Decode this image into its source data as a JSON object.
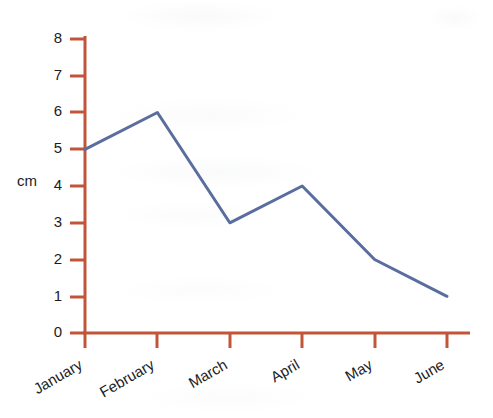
{
  "chart_data": {
    "type": "line",
    "title": "",
    "subtitle": "",
    "xlabel": "",
    "ylabel": "cm",
    "categories": [
      "January",
      "February",
      "March",
      "April",
      "May",
      "June"
    ],
    "values": [
      5,
      6,
      3,
      4,
      2,
      1
    ],
    "series": [
      {
        "name": "cm",
        "values": [
          5,
          6,
          3,
          4,
          2,
          1
        ]
      }
    ],
    "ylim": [
      0,
      8
    ],
    "y_ticks": [
      "0",
      "1",
      "2",
      "3",
      "4",
      "5",
      "6",
      "7",
      "8"
    ],
    "grid": false,
    "legend": "none",
    "x_tick_label_rotation": "-30",
    "colors": {
      "line": "#5a6d9e",
      "axis": "#c0553a",
      "tick_text": "#1c1c1c",
      "background": "#ffffff"
    }
  },
  "axes": {
    "y_axis_name": "cm",
    "y_tick_labels": [
      "8",
      "7",
      "6",
      "5",
      "4",
      "3",
      "2",
      "1",
      "0"
    ],
    "x_tick_labels": [
      "January",
      "February",
      "March",
      "April",
      "May",
      "June"
    ]
  }
}
